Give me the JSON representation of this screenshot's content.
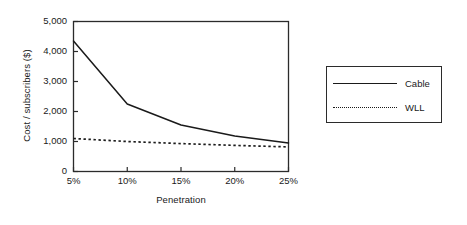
{
  "chart_data": {
    "type": "line",
    "title": "",
    "xlabel": "Penetration",
    "ylabel": "Cost / subscribers ($)",
    "x": [
      5,
      10,
      15,
      20,
      25
    ],
    "categories": [
      "5%",
      "10%",
      "15%",
      "20%",
      "25%"
    ],
    "xtick_labels": [
      "5%",
      "10%",
      "15%",
      "20%",
      "25%"
    ],
    "ytick_labels": [
      "0",
      "1,000",
      "2,000",
      "3,000",
      "4,000",
      "5,000"
    ],
    "ytick_values": [
      0,
      1000,
      2000,
      3000,
      4000,
      5000
    ],
    "xlim": [
      5,
      25
    ],
    "ylim": [
      0,
      5000
    ],
    "grid": false,
    "legend_position": "right-outside",
    "series": [
      {
        "name": "Cable",
        "style": "solid",
        "color": "#1a1a1a",
        "values": [
          4350,
          2250,
          1550,
          1180,
          950
        ]
      },
      {
        "name": "WLL",
        "style": "dotted",
        "color": "#1a1a1a",
        "values": [
          1100,
          1000,
          930,
          870,
          820
        ]
      }
    ]
  },
  "legend": {
    "items": [
      {
        "label": "Cable",
        "style": "solid"
      },
      {
        "label": "WLL",
        "style": "dotted"
      }
    ]
  }
}
